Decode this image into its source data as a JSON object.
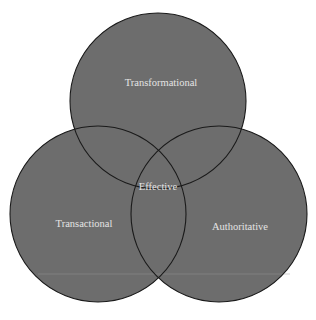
{
  "diagram": {
    "type": "venn",
    "fill_color": "#6d6d6d",
    "stroke_color": "#1a1a1a",
    "label_color": "#e4e4e4",
    "sets": [
      {
        "id": "transformational",
        "label": "Transformational",
        "cx": 158,
        "cy": 101,
        "r": 88
      },
      {
        "id": "transactional",
        "label": "Transactional",
        "cx": 98,
        "cy": 214,
        "r": 88
      },
      {
        "id": "authoritative",
        "label": "Authoritative",
        "cx": 219,
        "cy": 214,
        "r": 88
      }
    ],
    "intersection": {
      "label": "Effective"
    }
  }
}
